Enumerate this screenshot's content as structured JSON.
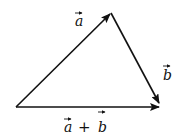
{
  "diagram": {
    "type": "vector-addition-triangle",
    "colors": {
      "stroke": "#111111",
      "background": "#ffffff"
    },
    "vertices": {
      "origin": {
        "x": 16,
        "y": 107
      },
      "apex": {
        "x": 111,
        "y": 13
      },
      "end": {
        "x": 160,
        "y": 104
      }
    },
    "vectors": [
      {
        "id": "a",
        "label": "a",
        "from": "origin",
        "to": "apex"
      },
      {
        "id": "b",
        "label": "b",
        "from": "apex",
        "to": "end"
      },
      {
        "id": "sum",
        "label": "a + b",
        "from": "origin",
        "to": "end"
      }
    ],
    "labels": {
      "a": "a",
      "b": "b",
      "sum_a": "a",
      "sum_plus": "+",
      "sum_b": "b"
    }
  }
}
